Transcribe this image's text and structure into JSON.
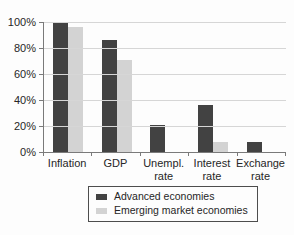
{
  "chart_data": {
    "type": "bar",
    "categories": [
      "Inflation",
      "GDP",
      "Unempl.\nrate",
      "Interest\nrate",
      "Exchange\nrate"
    ],
    "series": [
      {
        "name": "Advanced economies",
        "color": "#424242",
        "values": [
          100,
          86,
          21,
          36,
          8
        ]
      },
      {
        "name": "Emerging market economies",
        "color": "#d3d3d3",
        "values": [
          96,
          71,
          0,
          8,
          0
        ]
      }
    ],
    "title": "",
    "xlabel": "",
    "ylabel": "",
    "y_ticks": [
      "0%",
      "20%",
      "40%",
      "60%",
      "80%",
      "100%"
    ],
    "ylim": [
      0,
      100
    ],
    "grid": "horizontal",
    "legend_position": "bottom"
  }
}
